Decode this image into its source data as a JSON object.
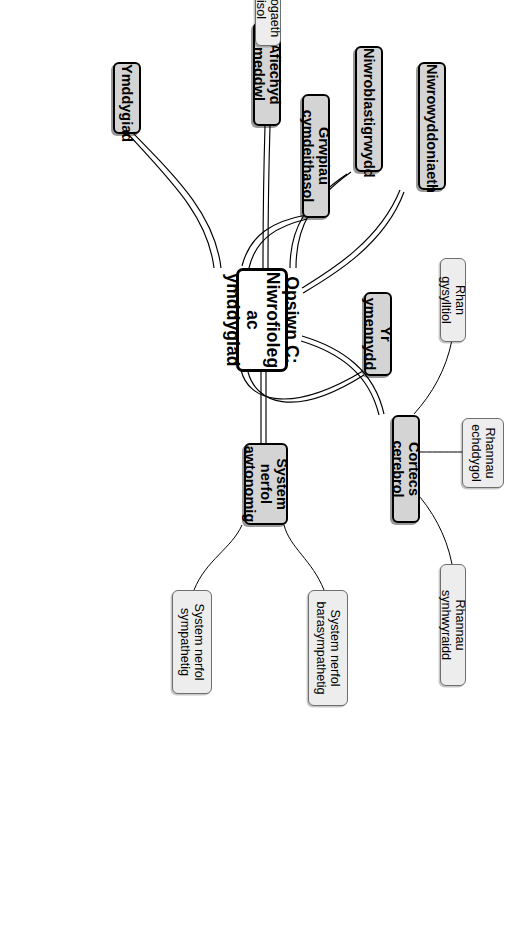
{
  "diagram": {
    "type": "mind-map",
    "orientation": "rotated-90-clockwise",
    "language": "cy",
    "colors": {
      "root_fill": "#ffffff",
      "root_border": "#000000",
      "level1_fill": "#d4d4d4",
      "level1_border": "#000000",
      "level2_fill": "#ededed",
      "level2_border": "#6e6e6e",
      "background": "#ffffff",
      "text": "#000000"
    },
    "root": {
      "label": "Opsiwn C: Niwrofioleg ac ymddygiad"
    },
    "branches": [
      {
        "id": "b1",
        "label": "Grwpiau cymdeithasol",
        "children": []
      },
      {
        "id": "b2",
        "label": "Yr ymennydd",
        "children": []
      },
      {
        "id": "b3",
        "label": "Ymddygiad",
        "children": []
      },
      {
        "id": "b4",
        "label": "Afiechyd meddwl",
        "children": [
          {
            "id": "c1",
            "label": "Swyddogaeth cortisol"
          }
        ]
      },
      {
        "id": "b5",
        "label": "System nerfol awtonomig",
        "children": [
          {
            "id": "c2",
            "label": "System nerfol barasympathetig"
          },
          {
            "id": "c3",
            "label": "System nerfol sympathetig"
          }
        ]
      },
      {
        "id": "b6",
        "label": "Niwroblastigrwydd",
        "children": []
      },
      {
        "id": "b7",
        "label": "Niwrowyddoniaeth",
        "children": []
      },
      {
        "id": "b8",
        "label": "Cortecs cerebrol",
        "children": [
          {
            "id": "c4",
            "label": "Rhan gysylltiol"
          },
          {
            "id": "c5",
            "label": "Rhannau echddygol"
          },
          {
            "id": "c6",
            "label": "Rhannau synhwyraidd"
          }
        ]
      }
    ]
  }
}
